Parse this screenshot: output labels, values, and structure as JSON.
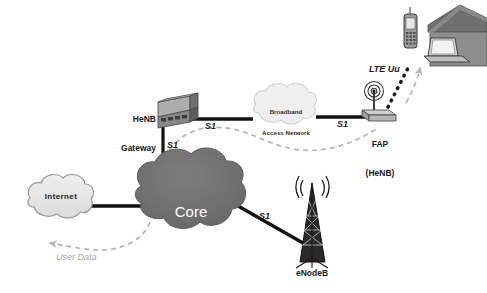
{
  "diagram": {
    "colors": {
      "core_cloud_fill": "#6e6e6e",
      "light_cloud_fill": "#e4e4e4",
      "cloud_stroke": "#9a9a9a",
      "link_line": "#111111",
      "dashed_path": "#b0b0b0",
      "text_dark": "#1a1a1a",
      "text_light": "#ffffff",
      "user_data_text": "#9a9a9a",
      "house_body": "#8d8d8d",
      "house_roof": "#6f6f6f",
      "device_gray": "#8a8a8a"
    },
    "nodes": [
      {
        "id": "henb-gateway",
        "label": "HeNB\nGateway",
        "label_line1": "HeNB",
        "label_line2": "Gateway",
        "icon": "router-box-icon"
      },
      {
        "id": "broadband-access-network",
        "label": "Broadband\nAccess Network",
        "label_line1": "Broadband",
        "label_line2": "Access Network",
        "icon": "cloud-icon"
      },
      {
        "id": "fap-henb",
        "label": "FAP\n(HeNB)",
        "label_line1": "FAP",
        "label_line2": "(HeNB)",
        "icon": "femtocell-access-point-icon"
      },
      {
        "id": "core-network",
        "label": "Core\nnetwork",
        "label_line1": "Core",
        "label_line2": "network",
        "icon": "cloud-icon"
      },
      {
        "id": "internet",
        "label": "Internet",
        "icon": "cloud-icon"
      },
      {
        "id": "enodeb",
        "label": "eNodeB",
        "icon": "cell-tower-icon"
      },
      {
        "id": "home",
        "label": "",
        "icon": "house-icon"
      },
      {
        "id": "laptop",
        "label": "",
        "icon": "laptop-icon"
      },
      {
        "id": "mobile-phone",
        "label": "",
        "icon": "mobile-phone-icon"
      }
    ],
    "link_labels": {
      "s1_gateway_to_broadband": "S1",
      "s1_broadband_to_fap": "S1",
      "s1_gateway_to_core": "S1",
      "s1_core_to_enodeb": "S1",
      "lte_uu": "LTE Uu",
      "user_data": "User Data"
    }
  }
}
